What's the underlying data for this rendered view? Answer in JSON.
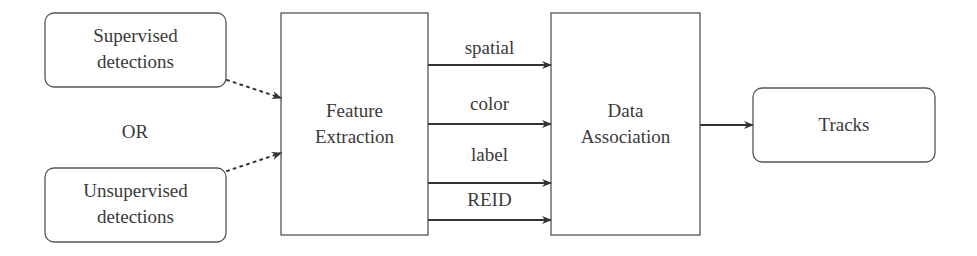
{
  "diagram": {
    "inputs": [
      {
        "id": "supervised",
        "line1": "Supervised",
        "line2": "detections"
      },
      {
        "id": "unsupervised",
        "line1": "Unsupervised",
        "line2": "detections"
      }
    ],
    "or_label": "OR",
    "feature_extraction": {
      "line1": "Feature",
      "line2": "Extraction"
    },
    "features": [
      {
        "label": "spatial"
      },
      {
        "label": "color"
      },
      {
        "label": "label"
      },
      {
        "label": "REID"
      }
    ],
    "data_association": {
      "line1": "Data",
      "line2": "Association"
    },
    "output": {
      "label": "Tracks"
    },
    "colors": {
      "stroke": "#444444",
      "arrow": "#333333",
      "text": "#3a3a3a",
      "background": "#ffffff"
    }
  }
}
